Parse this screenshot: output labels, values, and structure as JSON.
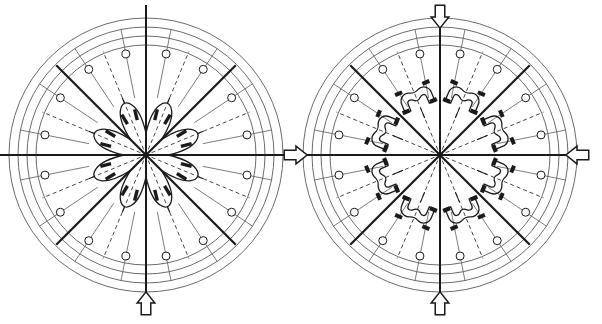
{
  "figure": {
    "background_color": "#ffffff",
    "ink_color": "#1a1a1a",
    "thin_color": "#5a5a5a",
    "caption_text": ""
  },
  "panels": [
    {
      "id": "left-panel",
      "name": "contracted-state-diagram",
      "state_label": "contracted",
      "center": {
        "x": 146,
        "y": 155
      },
      "rings": [
        {
          "name": "ring-outer-4",
          "r": 137
        },
        {
          "name": "ring-outer-3",
          "r": 128
        },
        {
          "name": "ring-outer-2",
          "r": 119
        },
        {
          "name": "ring-outer-1",
          "r": 110
        }
      ],
      "bold_axes": [
        {
          "name": "axis-vertical",
          "angle_deg": 90,
          "length": 150
        },
        {
          "name": "axis-horizontal",
          "angle_deg": 0,
          "length": 150
        },
        {
          "name": "axis-diagonal-45",
          "angle_deg": 45,
          "length": 127
        },
        {
          "name": "axis-diagonal-135",
          "angle_deg": 135,
          "length": 127
        }
      ],
      "spoke_count": 16,
      "marker_circle_radius": 4,
      "marker_circle_distance": 103,
      "lobe_count": 8,
      "lobe_inner_radius": 22,
      "lobe_outer_radius": 56,
      "jaws_joined": true
    },
    {
      "id": "right-panel",
      "name": "expanded-state-diagram",
      "state_label": "expanded",
      "center": {
        "x": 440,
        "y": 155
      },
      "rings": [
        {
          "name": "ring-outer-4",
          "r": 137
        },
        {
          "name": "ring-outer-3",
          "r": 128
        },
        {
          "name": "ring-outer-2",
          "r": 119
        },
        {
          "name": "ring-outer-1",
          "r": 110
        }
      ],
      "bold_axes": [
        {
          "name": "axis-vertical",
          "angle_deg": 90,
          "length": 143
        },
        {
          "name": "axis-horizontal",
          "angle_deg": 0,
          "length": 143
        },
        {
          "name": "axis-diagonal-45",
          "angle_deg": 45,
          "length": 127
        },
        {
          "name": "axis-diagonal-135",
          "angle_deg": 135,
          "length": 127
        }
      ],
      "spoke_count": 16,
      "marker_circle_radius": 4,
      "marker_circle_distance": 103,
      "lobe_count": 8,
      "jaw_distance": 62,
      "jaws_joined": false
    }
  ],
  "arrows": [
    {
      "name": "arrow-transition-right",
      "direction": "right",
      "x": 295,
      "y": 155,
      "size": 17
    },
    {
      "name": "arrow-load-top",
      "direction": "down",
      "x": 440,
      "y": 16,
      "size": 17
    },
    {
      "name": "arrow-load-bottom",
      "direction": "up",
      "x": 440,
      "y": 304,
      "size": 17
    },
    {
      "name": "arrow-load-right",
      "direction": "left",
      "x": 578,
      "y": 155,
      "size": 17
    },
    {
      "name": "arrow-load-left-panel-bottom",
      "direction": "up",
      "x": 146,
      "y": 304,
      "size": 17
    }
  ]
}
